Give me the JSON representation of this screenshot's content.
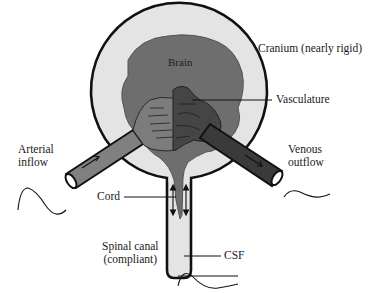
{
  "diagram": {
    "type": "anatomical-schematic",
    "labels": {
      "brain": "Brain",
      "cranium": "Cranium (nearly rigid)",
      "vasculature": "Vasculature",
      "arterial_inflow": "Arterial\ninflow",
      "venous_outflow": "Venous\noutflow",
      "cord": "Cord",
      "csf": "CSF",
      "spinal_canal": "Spinal canal\n(compliant)"
    },
    "colors": {
      "background": "#ffffff",
      "cranium_fill": "#e4e4e4",
      "cranium_outline": "#111111",
      "brain_fill": "#6e6e6e",
      "arterial_fill": "#808080",
      "venous_fill": "#3a3a3a",
      "venous_vasculature": "#404040",
      "csf_fill": "#e4e4e4",
      "text": "#1a1a1a"
    },
    "waveforms": [
      {
        "name": "arterial-pulse-waveform",
        "location": "below arterial inflow"
      },
      {
        "name": "venous-waveform",
        "location": "right of venous outflow"
      },
      {
        "name": "csf-pulse-waveform",
        "location": "below spinal canal"
      }
    ],
    "flow_arrows": [
      {
        "name": "arterial-flow-arrow",
        "direction": "into cranium"
      },
      {
        "name": "venous-flow-arrow",
        "direction": "out of cranium"
      },
      {
        "name": "csf-bidirectional-arrows",
        "direction": "up/down along cord",
        "count": 2
      }
    ]
  }
}
